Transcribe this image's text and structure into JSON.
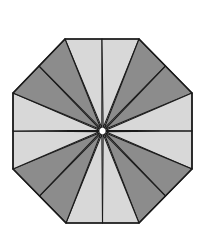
{
  "figure": {
    "title": "",
    "sections": 16,
    "colors": {
      "light": "#d8d8d8",
      "dark": "#8c8c8c",
      "stroke": "#1a1a1a",
      "gap": "#ffffff"
    },
    "pattern": [
      "light",
      "light",
      "dark",
      "dark",
      "light",
      "light",
      "dark",
      "dark",
      "light",
      "light",
      "dark",
      "dark",
      "light",
      "light",
      "dark",
      "dark"
    ]
  }
}
